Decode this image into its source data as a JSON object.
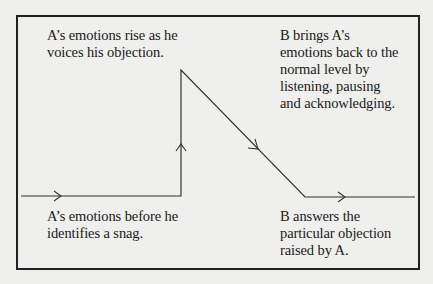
{
  "diagram": {
    "type": "emotion-flow",
    "labels": {
      "rise": {
        "lines": [
          "A’s emotions rise as he",
          "voices his objection."
        ]
      },
      "back_to_normal": {
        "lines": [
          "B brings A’s",
          "emotions back to the",
          "normal level by",
          "listening, pausing",
          "and acknowledging."
        ]
      },
      "before": {
        "lines": [
          "A’s emotions before he",
          "identifies a snag."
        ]
      },
      "answers": {
        "lines": [
          "B answers the",
          "particular objection",
          "raised by A."
        ]
      }
    },
    "flow_path": {
      "points": [
        [
          21,
          196
        ],
        [
          181,
          196
        ],
        [
          181,
          70
        ],
        [
          305,
          197
        ],
        [
          415,
          197
        ]
      ],
      "arrows": [
        {
          "direction": "right",
          "at": [
            60,
            196
          ]
        },
        {
          "direction": "up",
          "at": [
            181,
            145
          ]
        },
        {
          "direction": "down-right",
          "at": [
            258,
            149
          ]
        },
        {
          "direction": "right",
          "at": [
            344,
            197
          ]
        }
      ]
    },
    "colors": {
      "background": "#efefed",
      "line": "#333333",
      "border": "#222222",
      "text": "#1a1a1a"
    }
  }
}
